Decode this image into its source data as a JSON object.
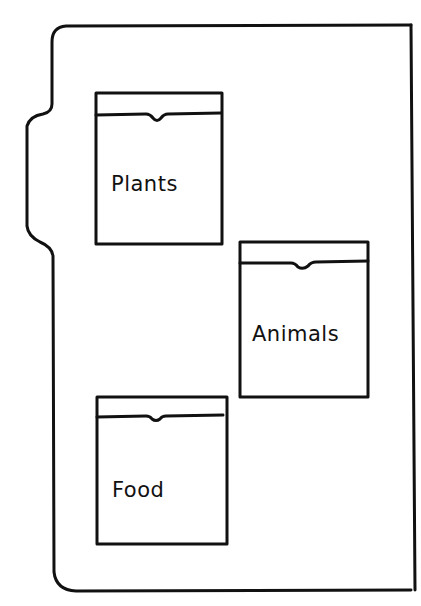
{
  "diagram": {
    "stroke_color": "#111111",
    "background": "#ffffff",
    "pockets": [
      {
        "label": "Plants"
      },
      {
        "label": "Animals"
      },
      {
        "label": "Food"
      }
    ]
  }
}
